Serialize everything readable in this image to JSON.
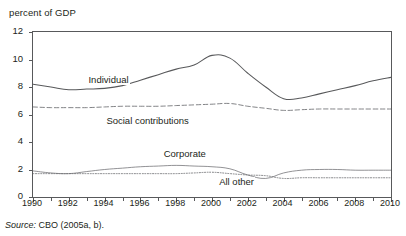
{
  "figure": {
    "unit_label": "percent of GDP",
    "cutoff_text": "·",
    "source_prefix": "Source:",
    "source_text": " CBO (2005a, b)."
  },
  "chart_data": {
    "type": "line",
    "title": "",
    "subtitle": "",
    "xlabel": "",
    "ylabel": "percent of GDP",
    "ylim": [
      0,
      12
    ],
    "xlim": [
      1990,
      2010
    ],
    "yticks": [
      0,
      2,
      4,
      6,
      8,
      10,
      12
    ],
    "ytick_labels": [
      "0",
      "2",
      "4",
      "6",
      "8",
      "10",
      "12"
    ],
    "xticks": [
      1990,
      1991,
      1992,
      1993,
      1994,
      1995,
      1996,
      1997,
      1998,
      1999,
      2000,
      2001,
      2002,
      2003,
      2004,
      2005,
      2006,
      2007,
      2008,
      2009,
      2010
    ],
    "xtick_labels_shown": [
      "1990",
      "1992",
      "1994",
      "1996",
      "1998",
      "2000",
      "2002",
      "2004",
      "2006",
      "2008",
      "2010"
    ],
    "grid": false,
    "legend_position": "inline-annotations",
    "x": [
      1990,
      1991,
      1992,
      1993,
      1994,
      1995,
      1996,
      1997,
      1998,
      1999,
      2000,
      2001,
      2002,
      2003,
      2004,
      2005,
      2006,
      2007,
      2008,
      2009,
      2010
    ],
    "series": [
      {
        "name": "Individual",
        "style": "solid",
        "color": "#58595b",
        "label_x": 1993.1,
        "label_y": 8.45,
        "values": [
          8.2,
          8.0,
          7.8,
          7.85,
          7.9,
          8.1,
          8.5,
          8.9,
          9.3,
          9.6,
          10.3,
          10.1,
          9.0,
          8.0,
          7.15,
          7.2,
          7.5,
          7.8,
          8.1,
          8.45,
          8.7
        ]
      },
      {
        "name": "Social contributions",
        "style": "dashed",
        "color": "#6d6e71",
        "label_x": 1994.1,
        "label_y": 5.45,
        "values": [
          6.55,
          6.5,
          6.5,
          6.5,
          6.55,
          6.6,
          6.6,
          6.6,
          6.65,
          6.7,
          6.75,
          6.8,
          6.6,
          6.45,
          6.3,
          6.35,
          6.4,
          6.4,
          6.4,
          6.4,
          6.4
        ]
      },
      {
        "name": "Corporate",
        "style": "solid-thin",
        "color": "#6d6e71",
        "label_x": 1997.3,
        "label_y": 3.05,
        "values": [
          1.9,
          1.75,
          1.7,
          1.85,
          2.0,
          2.1,
          2.2,
          2.25,
          2.3,
          2.25,
          2.2,
          2.05,
          1.6,
          1.35,
          1.75,
          1.95,
          2.0,
          2.0,
          1.95,
          1.95,
          1.95
        ]
      },
      {
        "name": "All other",
        "style": "dotted",
        "color": "#6d6e71",
        "label_x": 2000.4,
        "label_y": 1.05,
        "values": [
          1.7,
          1.7,
          1.7,
          1.7,
          1.7,
          1.7,
          1.7,
          1.7,
          1.7,
          1.75,
          1.8,
          1.7,
          1.6,
          1.55,
          1.35,
          1.4,
          1.4,
          1.4,
          1.4,
          1.4,
          1.4
        ]
      }
    ]
  }
}
